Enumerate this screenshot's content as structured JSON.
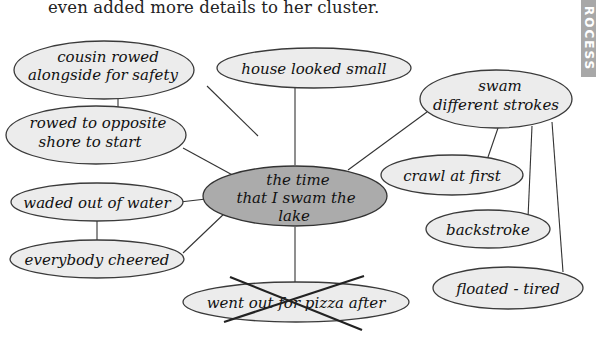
{
  "intro_text": "even added more details to her cluster.",
  "side_tab": {
    "label": "ROCESS",
    "color": "#a8a8a8"
  },
  "cluster": {
    "center": {
      "label_lines": [
        "the time",
        "that I swam the",
        "lake"
      ],
      "fill": "#ababab"
    },
    "nodes": [
      {
        "id": "cousin",
        "label_lines": [
          "cousin rowed",
          "alongside for safety"
        ]
      },
      {
        "id": "rowed",
        "label_lines": [
          "rowed to opposite",
          "shore to start"
        ]
      },
      {
        "id": "house",
        "label_lines": [
          "house looked small"
        ]
      },
      {
        "id": "swam",
        "label_lines": [
          "swam",
          "different strokes"
        ]
      },
      {
        "id": "crawl",
        "label_lines": [
          "crawl at first"
        ]
      },
      {
        "id": "backstroke",
        "label_lines": [
          "backstroke"
        ]
      },
      {
        "id": "floated",
        "label_lines": [
          "floated - tired"
        ]
      },
      {
        "id": "waded",
        "label_lines": [
          "waded out of water"
        ]
      },
      {
        "id": "cheered",
        "label_lines": [
          "everybody cheered"
        ]
      },
      {
        "id": "pizza",
        "label_lines": [
          "went out for pizza after"
        ],
        "crossed_out": true
      }
    ],
    "node_fill": "#ececec"
  }
}
